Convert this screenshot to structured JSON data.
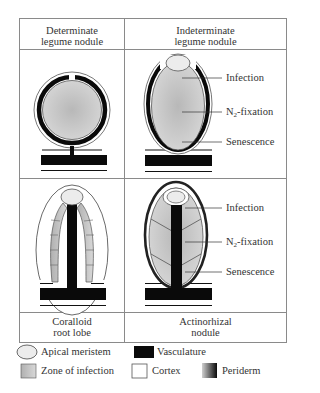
{
  "panels": [
    {
      "id": "determinate",
      "title_line1": "Determinate",
      "title_line2": "legume nodule"
    },
    {
      "id": "indeterminate",
      "title_line1": "Indeterminate",
      "title_line2": "legume nodule"
    },
    {
      "id": "coralloid",
      "title_line1": "Coralloid",
      "title_line2": "root lobe"
    },
    {
      "id": "actinorhizal",
      "title_line1": "Actinorhizal",
      "title_line2": "nodule"
    }
  ],
  "zone_labels": {
    "infection": "Infection",
    "n2_prefix": "N",
    "n2_sub": "2",
    "n2_suffix": "-fixation",
    "senescence": "Senescence"
  },
  "legend": {
    "apical_meristem": "Apical meristem",
    "vasculature": "Vasculature",
    "zone_of_infection": "Zone of infection",
    "cortex": "Cortex",
    "periderm": "Periderm"
  },
  "colors": {
    "infection_fill": "#c4c4c4",
    "meristem_fill": "#ececec",
    "vasculature": "#0a0a0a",
    "border": "#8a8a8a"
  }
}
